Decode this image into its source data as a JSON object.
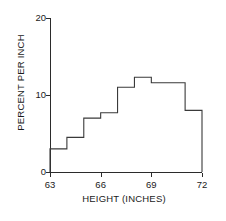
{
  "chart_data": {
    "type": "bar",
    "title": "",
    "subtitle": "",
    "xlabel": "HEIGHT (INCHES)",
    "ylabel": "PERCENT PER INCH",
    "xlim": [
      63,
      72
    ],
    "ylim": [
      0,
      20
    ],
    "xticks": [
      63,
      66,
      69,
      72
    ],
    "yticks": [
      0,
      10,
      20
    ],
    "xtick_labels": [
      "63",
      "66",
      "69",
      "72"
    ],
    "ytick_labels": [
      "0",
      "10",
      "20"
    ],
    "grid": false,
    "legend": null,
    "bin_edges": [
      63,
      64,
      65,
      66,
      67,
      68,
      69,
      70,
      71,
      72
    ],
    "bin_width": 1,
    "categories": [
      "63-64",
      "64-65",
      "65-66",
      "66-67",
      "67-68",
      "68-69",
      "69-70",
      "70-71",
      "71-72"
    ],
    "values": [
      3.0,
      4.5,
      7.0,
      7.7,
      11.0,
      12.3,
      11.6,
      11.6,
      8.0
    ],
    "annotations": []
  },
  "axis": {
    "y_title": "PERCENT PER INCH",
    "x_title": "HEIGHT (INCHES)",
    "y_labels": {
      "top": "20",
      "mid": "10",
      "bottom": "0"
    }
  },
  "colors": {
    "outline": "#3a3a3a",
    "axis": "#2b2b2b",
    "text": "#1a1a1a",
    "background": "#ffffff"
  }
}
